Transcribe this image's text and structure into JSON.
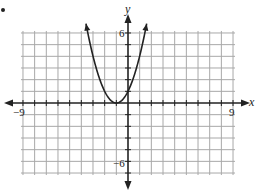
{
  "chart_data": {
    "type": "line",
    "title": "",
    "xlabel": "x",
    "ylabel": "y",
    "xlim": [
      -9,
      9
    ],
    "ylim": [
      -6,
      6
    ],
    "grid": true,
    "grid_step": 1,
    "tick_labels": {
      "x_min": "−9",
      "x_max": "9",
      "y_max": "6",
      "y_min": "−6"
    },
    "axes_arrows": true,
    "series": [
      {
        "name": "parabola",
        "description": "Upward-opening parabola with vertex approximately at (-1, 0), with arrowheads on both arms near the top of the grid. The curve shape is estimated from the image; no equation is shown in the image.",
        "vertex_estimate": [
          -1,
          0
        ],
        "points_estimate": [
          [
            -3.6,
            6.8
          ],
          [
            -3,
            4
          ],
          [
            -2,
            1
          ],
          [
            -1,
            0
          ],
          [
            0,
            1
          ],
          [
            1,
            4
          ],
          [
            1.6,
            6.8
          ]
        ],
        "arrows_at_ends": true
      }
    ],
    "legend": null
  },
  "labels": {
    "x_axis": "x",
    "y_axis": "y",
    "x_neg": "−9",
    "x_pos": "9",
    "y_pos": "6",
    "y_neg": "−6"
  },
  "colors": {
    "grid": "#a8a8a8",
    "axis": "#222222",
    "curve": "#222222",
    "background": "#ffffff"
  }
}
